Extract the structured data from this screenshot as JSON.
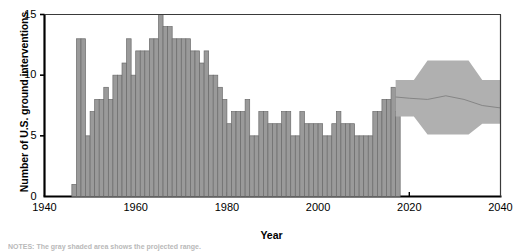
{
  "chart_data": {
    "type": "bar",
    "title": "",
    "subtitle": "",
    "xlabel": "Year",
    "ylabel": "Number of U.S. ground interventions",
    "xlim": [
      1940,
      2040
    ],
    "ylim": [
      0,
      15
    ],
    "xticks": [
      1940,
      1960,
      1980,
      2000,
      2020,
      2040
    ],
    "yticks": [
      0,
      5,
      10,
      15
    ],
    "grid": false,
    "legend": "none",
    "bar_color": "#9a9a9a",
    "bar_edge_color": "#6b6b6b",
    "band_color": "#b0b0b0",
    "projection_line_color": "#808080",
    "axis_color": "#000000",
    "notes": "NOTES: The gray shaded area shows the projected range.",
    "categories": [
      1946,
      1947,
      1948,
      1949,
      1950,
      1951,
      1952,
      1953,
      1954,
      1955,
      1956,
      1957,
      1958,
      1959,
      1960,
      1961,
      1962,
      1963,
      1964,
      1965,
      1966,
      1967,
      1968,
      1969,
      1970,
      1971,
      1972,
      1973,
      1974,
      1975,
      1976,
      1977,
      1978,
      1979,
      1980,
      1981,
      1982,
      1983,
      1984,
      1985,
      1986,
      1987,
      1988,
      1989,
      1990,
      1991,
      1992,
      1993,
      1994,
      1995,
      1996,
      1997,
      1998,
      1999,
      2000,
      2001,
      2002,
      2003,
      2004,
      2005,
      2006,
      2007,
      2008,
      2009,
      2010,
      2011,
      2012,
      2013,
      2014,
      2015,
      2016,
      2017
    ],
    "values": [
      1,
      13,
      13,
      5,
      7,
      8,
      8,
      9,
      8,
      10,
      10,
      11,
      13,
      10,
      12,
      12,
      12,
      13,
      13,
      15,
      14,
      14,
      13,
      13,
      13,
      13,
      12,
      12,
      11,
      12,
      10,
      10,
      9,
      8,
      6,
      7,
      7,
      7,
      8,
      5,
      5,
      7,
      7,
      6,
      6,
      6,
      7,
      7,
      5,
      5,
      7,
      6,
      6,
      6,
      6,
      5,
      5,
      6,
      7,
      6,
      6,
      6,
      5,
      5,
      5,
      5,
      7,
      7,
      8,
      8,
      9,
      7
    ],
    "projection": {
      "label": "projected range",
      "x_start": 2017,
      "x_end": 2040,
      "center_line": [
        {
          "x": 2017,
          "y": 8.2
        },
        {
          "x": 2020,
          "y": 8.1
        },
        {
          "x": 2024,
          "y": 8.0
        },
        {
          "x": 2028,
          "y": 8.3
        },
        {
          "x": 2032,
          "y": 8.0
        },
        {
          "x": 2036,
          "y": 7.5
        },
        {
          "x": 2040,
          "y": 7.3
        }
      ],
      "upper_bound": [
        {
          "x": 2017,
          "y": 9.6
        },
        {
          "x": 2021,
          "y": 9.6
        },
        {
          "x": 2024,
          "y": 11.2
        },
        {
          "x": 2033,
          "y": 11.2
        },
        {
          "x": 2036,
          "y": 9.6
        },
        {
          "x": 2040,
          "y": 9.6
        }
      ],
      "lower_bound": [
        {
          "x": 2017,
          "y": 6.6
        },
        {
          "x": 2021,
          "y": 6.6
        },
        {
          "x": 2024,
          "y": 5.1
        },
        {
          "x": 2033,
          "y": 5.1
        },
        {
          "x": 2036,
          "y": 6.0
        },
        {
          "x": 2040,
          "y": 6.0
        }
      ]
    }
  }
}
